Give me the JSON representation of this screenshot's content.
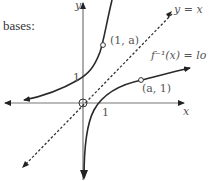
{
  "intro_text": "bases:",
  "axes": {
    "x_label": "x",
    "y_label": "y",
    "x_tick": "1",
    "y_tick": "1"
  },
  "curves": {
    "exponential": {
      "point_label": "(1, a)"
    },
    "logarithm": {
      "label": "f⁻¹(x) = lo",
      "point_label": "(a, 1)"
    },
    "identity": {
      "label": "y = x",
      "style": "dashed"
    }
  },
  "colors": {
    "curve": "#2a2a2a",
    "axis": "#555555",
    "dashed": "#333333",
    "text": "#555555"
  }
}
